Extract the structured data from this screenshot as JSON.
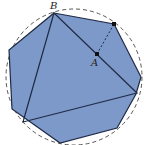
{
  "diagram": {
    "labels": {
      "B": "B",
      "A": "A"
    },
    "colors": {
      "fill": "#7d99c9",
      "stroke": "#1f2a44",
      "circle": "#555555"
    },
    "polygon": [
      [
        54,
        13
      ],
      [
        114,
        24
      ],
      [
        141,
        77
      ],
      [
        136,
        94
      ],
      [
        117,
        128
      ],
      [
        60,
        143
      ],
      [
        12,
        109
      ],
      [
        9,
        50
      ]
    ],
    "triangle": [
      [
        54,
        13
      ],
      [
        137,
        93
      ],
      [
        23,
        122
      ]
    ],
    "points": {
      "A": [
        97,
        54
      ],
      "top": [
        114,
        24
      ]
    }
  }
}
